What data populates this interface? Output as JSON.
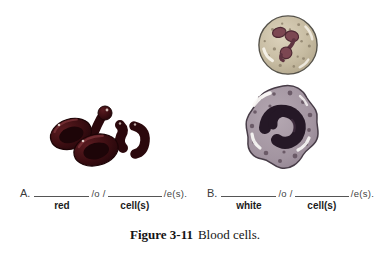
{
  "figure": {
    "caption": {
      "label": "Figure 3-11",
      "text": "Blood cells."
    }
  },
  "exercises": {
    "a": {
      "letter": "A.",
      "sep1": "/o /",
      "sep2": "/e(s).",
      "word1": "red",
      "word2": "cell(s)"
    },
    "b": {
      "letter": "B.",
      "sep1": "/o /",
      "sep2": "/e(s).",
      "word1": "white",
      "word2": "cell(s)"
    }
  },
  "illustrations": {
    "left": "red blood cells",
    "top_right": "white blood cell with segmented nucleus",
    "bottom_right": "white blood cell with band nucleus"
  },
  "colors": {
    "background": "#ffffff",
    "rbc_body": "#3a0d11",
    "rbc_dark": "#1d0508",
    "rbc_rim_highlight": "#7a3338",
    "wbc_top_cytoplasm": "#c6bba1",
    "wbc_top_nucleus": "#7c4752",
    "wbc_bottom_cytoplasm": "#a294a0",
    "wbc_bottom_nucleus": "#251826",
    "line": "#555555",
    "text": "#3f3f3f"
  }
}
